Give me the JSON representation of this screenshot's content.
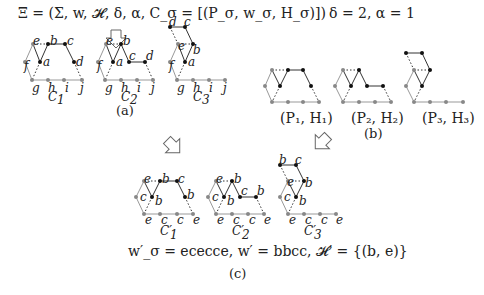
{
  "figure": {
    "top_equation": "Ξ = (Σ, w, 𝓗, δ, α, C_σ = [(P_σ, w_σ, H_σ)])",
    "params": "δ = 2, α = 1",
    "panel_a": {
      "caption": "(a)",
      "configs": [
        {
          "name": "C1",
          "label": "C₁",
          "nodes": [
            "e",
            "b",
            "c",
            "f",
            "a",
            "d",
            "g",
            "h",
            "i",
            "j"
          ]
        },
        {
          "name": "C2",
          "label": "C₂",
          "nodes": [
            "e",
            "b",
            "f",
            "a",
            "c",
            "d",
            "g",
            "h",
            "i",
            "j"
          ]
        },
        {
          "name": "C3",
          "label": "C₃",
          "nodes": [
            "d",
            "c",
            "e",
            "b",
            "f",
            "a",
            "g",
            "h",
            "i",
            "j"
          ]
        }
      ]
    },
    "panel_b": {
      "caption": "(b)",
      "pairs": [
        "(P₁, H₁)",
        "(P₂, H₂)",
        "(P₃, H₃)"
      ]
    },
    "panel_c": {
      "caption": "(c)",
      "configs": [
        {
          "name": "C1'",
          "label": "C′₁",
          "nodes": [
            "e",
            "b",
            "c",
            "c",
            "b",
            "b",
            "e",
            "c",
            "c",
            "e"
          ]
        },
        {
          "name": "C2'",
          "label": "C′₂",
          "nodes": [
            "e",
            "b",
            "c",
            "b",
            "c",
            "b",
            "e",
            "c",
            "c",
            "e"
          ]
        },
        {
          "name": "C3'",
          "label": "C′₃",
          "nodes": [
            "b",
            "c",
            "e",
            "b",
            "c",
            "b",
            "e",
            "c",
            "c",
            "e"
          ]
        }
      ],
      "equation": "w′_σ = ececce, w′ = bbcc, 𝓗′ = {(b, e)}"
    },
    "colors": {
      "black_node": "#111111",
      "gray_node": "#888888",
      "gray_edge": "#999999"
    }
  }
}
